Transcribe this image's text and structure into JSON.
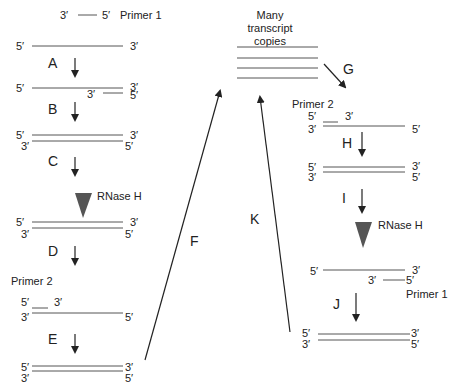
{
  "diagram": {
    "type": "process-cycle",
    "topic": "Transcription-mediated amplification cycle",
    "colors": {
      "strand": "#555555",
      "text": "#222222",
      "rnase_triangle": "#555555",
      "background": "#ffffff"
    },
    "primer1_top": {
      "left_end": "3′",
      "right_end": "5′",
      "label": "Primer 1"
    },
    "transcripts": {
      "label_line1": "Many",
      "label_line2": "transcript",
      "label_line3": "copies",
      "count": 4
    },
    "left_column": {
      "s1": {
        "top_left": "5′",
        "top_right": "3′"
      },
      "stepA": "A",
      "s2": {
        "top_left": "5′",
        "top_right": "3′",
        "primer_left": "3′",
        "primer_right": "5′"
      },
      "stepB": "B",
      "s3": {
        "top_left": "5′",
        "top_right": "3′",
        "bottom_left": "3′",
        "bottom_right": "5′"
      },
      "stepC": "C",
      "rnase": "RNase H",
      "s4": {
        "top_left": "5′",
        "top_right": "3′",
        "bottom_left": "3′",
        "bottom_right": "5′"
      },
      "stepD": "D",
      "primer2_label": "Primer 2",
      "s5": {
        "primer_left": "5′",
        "primer_right": "3′",
        "bottom_left": "3′",
        "bottom_right": "5′"
      },
      "stepE": "E",
      "s6": {
        "top_left": "5′",
        "top_right": "3′",
        "bottom_left": "3′",
        "bottom_right": "5′"
      }
    },
    "connectors": {
      "stepF": "F",
      "stepK": "K",
      "stepG": "G"
    },
    "right_column": {
      "primer2_label": "Primer 2",
      "s1": {
        "primer_left": "5′",
        "primer_right": "3′",
        "bottom_left": "3′",
        "bottom_right": "5′"
      },
      "stepH": "H",
      "s2": {
        "top_left": "5′",
        "top_right": "3′",
        "bottom_left": "3′",
        "bottom_right": "5′"
      },
      "stepI": "I",
      "rnase": "RNase H",
      "s3": {
        "top_left": "5′",
        "top_right": "3′",
        "primer_left": "3′",
        "primer_right": "5′"
      },
      "primer1_label": "Primer 1",
      "stepJ": "J",
      "s4": {
        "top_left": "5′",
        "top_right": "3′",
        "bottom_left": "3′",
        "bottom_right": "5′"
      }
    }
  }
}
